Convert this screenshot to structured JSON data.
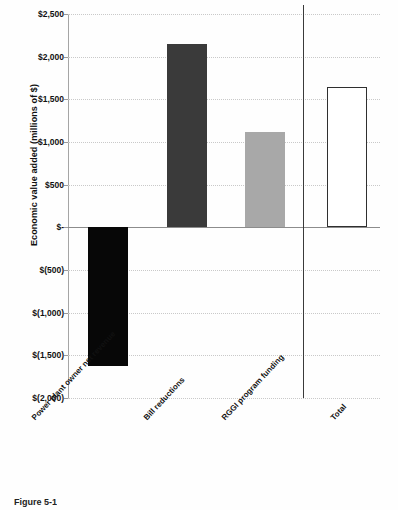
{
  "figure": {
    "caption": "Figure 5-1"
  },
  "chart_data": {
    "type": "bar",
    "title": "",
    "xlabel": "",
    "ylabel": "Economic value added (millions of $)",
    "categories": [
      "Power plant owner net revenue",
      "Bill reductions",
      "RGGI program funding",
      "Total"
    ],
    "values": [
      -1620,
      2150,
      1120,
      1640
    ],
    "ylim": [
      -2000,
      2500
    ],
    "ytick_values": [
      2500,
      2000,
      1500,
      1000,
      500,
      0,
      -500,
      -1000,
      -1500,
      -2000
    ],
    "ytick_labels": [
      "$2,500",
      "$2,000",
      "$1,500",
      "$1,000",
      "$500",
      "$-",
      "$(500)",
      "$(1,000)",
      "$(1,500)",
      "$(2,000)"
    ],
    "grid": true,
    "legend": "none",
    "bar_styles": [
      {
        "name": "power-plant-owner-net-revenue",
        "fill": "#070707",
        "outline": "none"
      },
      {
        "name": "bill-reductions",
        "fill": "#3a3a3a",
        "outline": "none"
      },
      {
        "name": "rggi-program-funding",
        "fill": "#a8a8a8",
        "outline": "none"
      },
      {
        "name": "total",
        "fill": "#ffffff",
        "outline": "#2f2f2f"
      }
    ],
    "separator_before_total": true,
    "colors": {
      "grid": "#c9c9c9",
      "axis": "#8c8c8c",
      "text": "#111111"
    }
  }
}
